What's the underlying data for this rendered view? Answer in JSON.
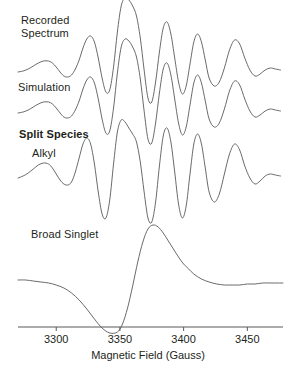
{
  "chart_data": {
    "type": "line",
    "title": "",
    "xlabel": "Magnetic Field (Gauss)",
    "ylabel": "",
    "xlim": [
      3270,
      3478
    ],
    "xticks": [
      3300,
      3350,
      3400,
      3450
    ],
    "xtick_labels": [
      "3300",
      "3350",
      "3400",
      "3450"
    ],
    "grid": false,
    "legend_position": "inline-left-labels",
    "series": [
      {
        "name": "Recorded Spectrum",
        "label": "Recorded Spectrum",
        "label_lines": [
          "Recorded",
          "Spectrum"
        ],
        "baseline_y": 72,
        "bold": false,
        "x": [
          3270,
          3274,
          3278,
          3282,
          3286,
          3290,
          3294,
          3297,
          3300,
          3303,
          3306,
          3309,
          3312,
          3315,
          3318,
          3321,
          3324,
          3327,
          3330,
          3333,
          3336,
          3339,
          3342,
          3345,
          3348,
          3351,
          3354,
          3357,
          3360,
          3363,
          3366,
          3369,
          3372,
          3375,
          3378,
          3381,
          3384,
          3387,
          3390,
          3393,
          3396,
          3399,
          3402,
          3405,
          3408,
          3411,
          3414,
          3417,
          3420,
          3424,
          3428,
          3432,
          3436,
          3440,
          3444,
          3448,
          3452,
          3456,
          3460,
          3464,
          3468,
          3472,
          3476
        ],
        "y": [
          0,
          1,
          3,
          6,
          9,
          11,
          11,
          9,
          5,
          0,
          -4,
          -5,
          -3,
          3,
          12,
          24,
          33,
          36,
          30,
          14,
          -6,
          -20,
          -18,
          5,
          40,
          66,
          74,
          72,
          66,
          56,
          34,
          2,
          -26,
          -30,
          -10,
          20,
          44,
          50,
          38,
          14,
          -10,
          -22,
          -14,
          8,
          30,
          38,
          30,
          12,
          -6,
          -14,
          -10,
          4,
          22,
          32,
          28,
          14,
          2,
          -4,
          -2,
          2,
          4,
          3,
          2
        ]
      },
      {
        "name": "Simulation",
        "label": "Simulation",
        "label_lines": [
          "Simulation"
        ],
        "baseline_y": 113,
        "bold": false,
        "x": [
          3270,
          3274,
          3278,
          3282,
          3286,
          3290,
          3294,
          3297,
          3300,
          3303,
          3306,
          3309,
          3312,
          3315,
          3318,
          3321,
          3324,
          3327,
          3330,
          3333,
          3336,
          3339,
          3342,
          3345,
          3348,
          3351,
          3354,
          3357,
          3360,
          3363,
          3366,
          3369,
          3372,
          3375,
          3378,
          3381,
          3384,
          3387,
          3390,
          3393,
          3396,
          3399,
          3402,
          3405,
          3408,
          3411,
          3414,
          3417,
          3420,
          3424,
          3428,
          3432,
          3436,
          3440,
          3444,
          3448,
          3452,
          3456,
          3460,
          3464,
          3468,
          3472,
          3476
        ],
        "y": [
          0,
          1,
          3,
          6,
          9,
          11,
          11,
          9,
          5,
          0,
          -4,
          -5,
          -3,
          3,
          12,
          24,
          33,
          36,
          30,
          14,
          -6,
          -20,
          -18,
          5,
          40,
          66,
          74,
          72,
          66,
          56,
          34,
          2,
          -26,
          -30,
          -10,
          20,
          44,
          50,
          38,
          14,
          -10,
          -22,
          -14,
          8,
          30,
          38,
          30,
          12,
          -6,
          -14,
          -10,
          4,
          22,
          32,
          28,
          14,
          2,
          -4,
          -2,
          2,
          4,
          3,
          2
        ]
      },
      {
        "name": "Split Species Alkyl",
        "label": "Split Species",
        "label_lines": [
          "Split Species",
          "Alkyl"
        ],
        "sublabel": "Alkyl",
        "baseline_y": 178,
        "bold": true,
        "x": [
          3270,
          3274,
          3278,
          3282,
          3286,
          3290,
          3294,
          3297,
          3300,
          3303,
          3306,
          3309,
          3312,
          3315,
          3318,
          3321,
          3324,
          3327,
          3330,
          3333,
          3336,
          3339,
          3342,
          3345,
          3348,
          3351,
          3354,
          3357,
          3360,
          3363,
          3366,
          3369,
          3372,
          3375,
          3378,
          3381,
          3384,
          3387,
          3390,
          3393,
          3396,
          3399,
          3402,
          3405,
          3408,
          3411,
          3414,
          3417,
          3420,
          3424,
          3428,
          3432,
          3436,
          3440,
          3444,
          3448,
          3452,
          3456,
          3460,
          3464,
          3468,
          3472,
          3476
        ],
        "y": [
          0,
          2,
          5,
          9,
          13,
          15,
          14,
          10,
          4,
          -2,
          -6,
          -7,
          -4,
          6,
          20,
          34,
          40,
          34,
          14,
          -14,
          -36,
          -40,
          -22,
          14,
          46,
          58,
          56,
          50,
          44,
          36,
          16,
          -14,
          -40,
          -44,
          -24,
          12,
          42,
          50,
          36,
          6,
          -26,
          -40,
          -28,
          4,
          34,
          44,
          34,
          10,
          -14,
          -24,
          -16,
          4,
          24,
          34,
          28,
          12,
          0,
          -6,
          -3,
          2,
          4,
          3,
          2
        ]
      },
      {
        "name": "Broad Singlet",
        "label": "Broad Singlet",
        "label_lines": [
          "Broad Singlet"
        ],
        "baseline_y": 280,
        "bold": false,
        "x": [
          3270,
          3276,
          3282,
          3288,
          3294,
          3300,
          3306,
          3312,
          3318,
          3324,
          3330,
          3336,
          3342,
          3348,
          3352,
          3356,
          3360,
          3364,
          3368,
          3372,
          3376,
          3380,
          3384,
          3388,
          3392,
          3396,
          3400,
          3404,
          3408,
          3414,
          3420,
          3426,
          3432,
          3438,
          3444,
          3450,
          3456,
          3462,
          3468,
          3474,
          3478
        ],
        "y": [
          0,
          0,
          -1,
          -2,
          -3,
          -5,
          -8,
          -13,
          -20,
          -29,
          -39,
          -48,
          -53,
          -52,
          -44,
          -28,
          -6,
          18,
          38,
          51,
          55,
          53,
          47,
          39,
          31,
          23,
          16,
          11,
          6,
          1,
          -2,
          -4,
          -5,
          -5,
          -5,
          -4,
          -4,
          -3,
          -3,
          -3,
          -3
        ]
      }
    ]
  },
  "axis": {
    "title": "Magnetic Field (Gauss)",
    "tick_values": [
      3300,
      3350,
      3400,
      3450
    ],
    "tick_labels": [
      "3300",
      "3350",
      "3400",
      "3450"
    ]
  },
  "labels": {
    "recorded_line1": "Recorded",
    "recorded_line2": "Spectrum",
    "simulation": "Simulation",
    "split_species": "Split Species",
    "alkyl": "Alkyl",
    "broad_singlet": "Broad Singlet"
  },
  "style": {
    "line_color": "#58595b",
    "text_color": "#231f20",
    "axis_color": "#58595b",
    "background": "#ffffff"
  }
}
